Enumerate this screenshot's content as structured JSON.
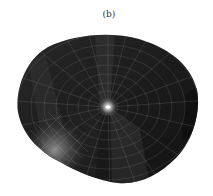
{
  "figure": {
    "label": "(b)",
    "colors": {
      "surface_dark": "#1a1a1a",
      "surface_mid": "#2e2e2e",
      "grid_line": "#8a8a8a",
      "highlight": "#e8e8e8",
      "background": "#ffffff"
    }
  }
}
